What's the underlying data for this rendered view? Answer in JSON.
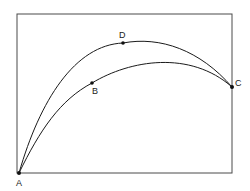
{
  "diagram": {
    "frame": {
      "x": 17,
      "y": 14,
      "width": 215,
      "height": 159,
      "stroke": "#4a4a4a"
    },
    "curve_color": "#1a1a1a",
    "points": [
      {
        "id": "A",
        "label": "A",
        "x": 19,
        "y": 173,
        "label_x": 17,
        "label_y": 186
      },
      {
        "id": "B",
        "label": "B",
        "x": 92,
        "y": 83,
        "label_x": 92,
        "label_y": 94
      },
      {
        "id": "C",
        "label": "C",
        "x": 232,
        "y": 87,
        "label_x": 235,
        "label_y": 86
      },
      {
        "id": "D",
        "label": "D",
        "x": 123,
        "y": 43,
        "label_x": 119,
        "label_y": 38
      }
    ],
    "curves": [
      {
        "id": "upper",
        "through": [
          "A",
          "D",
          "C"
        ]
      },
      {
        "id": "lower",
        "through": [
          "A",
          "B",
          "C"
        ]
      }
    ]
  }
}
